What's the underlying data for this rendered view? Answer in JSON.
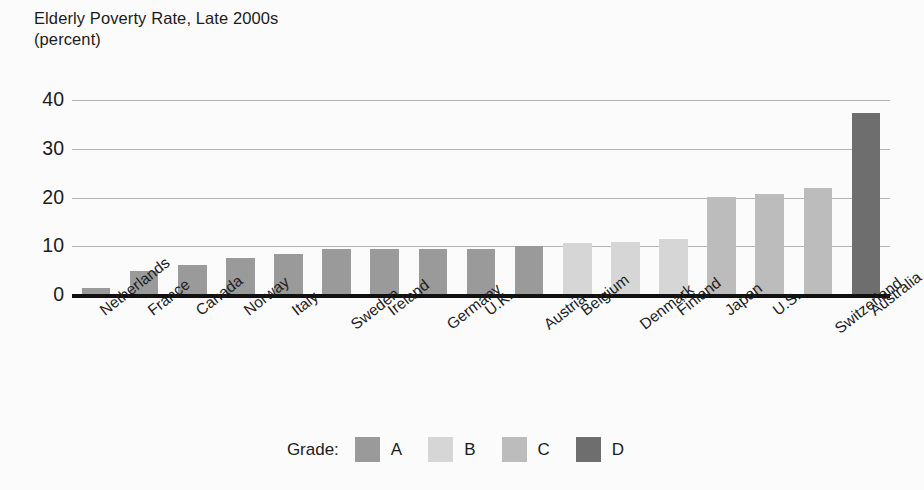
{
  "title": {
    "line1": "Elderly Poverty Rate, Late 2000s",
    "line2": "(percent)"
  },
  "legend": {
    "title": "Grade:",
    "items": [
      {
        "label": "A",
        "color": "#9a9a9a"
      },
      {
        "label": "B",
        "color": "#d6d6d6"
      },
      {
        "label": "C",
        "color": "#bcbcbc"
      },
      {
        "label": "D",
        "color": "#6e6e6e"
      }
    ]
  },
  "colors": {
    "grid": "#b2b2b2",
    "axis": "#111111",
    "background": "#fbfbfb",
    "text": "#1c1c1c"
  },
  "chart_data": {
    "type": "bar",
    "title": "Elderly Poverty Rate, Late 2000s (percent)",
    "xlabel": "",
    "ylabel": "percent",
    "ylim": [
      0,
      40
    ],
    "yticks": [
      0,
      10,
      20,
      30,
      40
    ],
    "grid": true,
    "legend_position": "bottom-center",
    "legend_title": "Grade:",
    "categories": [
      "Netherlands",
      "France",
      "Canada",
      "Norway",
      "Italy",
      "Sweden",
      "Ireland",
      "Germany",
      "U.K.",
      "Austria",
      "Belgium",
      "Denmark",
      "Finland",
      "Japan",
      "U.S.",
      "Switzerland",
      "Australia"
    ],
    "values": [
      1.5,
      5.0,
      6.1,
      7.6,
      8.4,
      9.4,
      9.4,
      9.4,
      9.5,
      10.0,
      10.6,
      10.9,
      11.5,
      20.1,
      20.8,
      22.0,
      37.3
    ],
    "grades": [
      "A",
      "A",
      "A",
      "A",
      "A",
      "A",
      "A",
      "A",
      "A",
      "A",
      "B",
      "B",
      "B",
      "C",
      "C",
      "C",
      "D"
    ],
    "grade_colors": {
      "A": "#9a9a9a",
      "B": "#d6d6d6",
      "C": "#bcbcbc",
      "D": "#6e6e6e"
    }
  }
}
